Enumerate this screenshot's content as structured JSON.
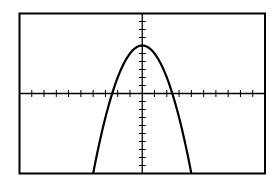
{
  "chart_data": {
    "type": "line",
    "title": "",
    "xlabel": "",
    "ylabel": "",
    "xlim": [
      -10,
      10
    ],
    "ylim": [
      -10,
      10
    ],
    "xtick_step": 1,
    "ytick_step": 1,
    "grid": false,
    "legend": "none",
    "series": [
      {
        "name": "y = 6 - x^2",
        "function": "6 - x^2",
        "vertex": [
          0,
          6
        ],
        "x_intercepts": [
          -2.45,
          2.45
        ],
        "x": [
          -4,
          -3,
          -2,
          -1,
          0,
          1,
          2,
          3,
          4
        ],
        "y": [
          -10,
          -3,
          2,
          5,
          6,
          5,
          2,
          -3,
          -10
        ]
      }
    ],
    "colors": {
      "curve": "#000000",
      "axes": "#000000",
      "frame": "#000000",
      "background": "#ffffff"
    }
  }
}
